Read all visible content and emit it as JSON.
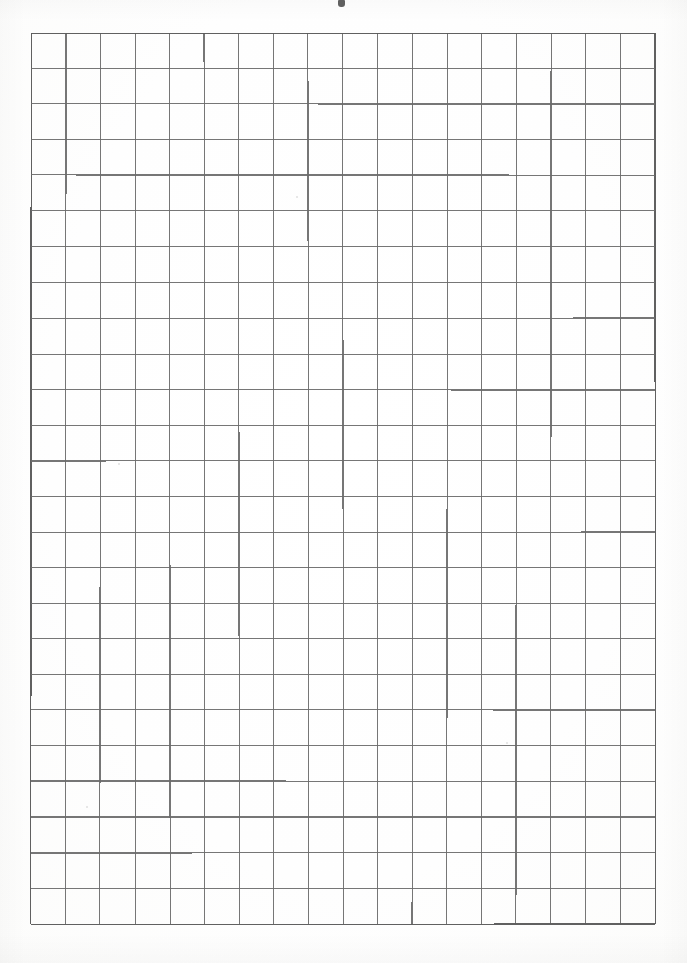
{
  "document": {
    "type": "scanned-grid-paper",
    "title": "Blank grid paper sheet",
    "description": "A scanned blank sheet of squared graph paper with no written content",
    "page_width_px": 687,
    "page_height_px": 963,
    "background_color": "#ffffff"
  },
  "grid": {
    "name": "squared-grid",
    "columns": 18,
    "rows": 25,
    "origin_x_px": 31,
    "origin_y_px": 33,
    "width_px": 624,
    "height_px": 891,
    "cell_width_px": 34.7,
    "cell_height_px": 35.6,
    "line_color": "#6b6b6b",
    "outer_line_color": "#5a5a5a",
    "line_width_px": 1.15,
    "outer_line_width_px": 1.45,
    "cell_fill": "#ffffff"
  },
  "artifacts": {
    "top_edge_mark": {
      "label": "scan-edge-mark",
      "x_px": 338,
      "y_px": 0,
      "color": "#3a3a3a"
    },
    "specks": [
      {
        "x_px": 118,
        "y_px": 463,
        "size_px": 2
      },
      {
        "x_px": 296,
        "y_px": 196,
        "size_px": 2
      },
      {
        "x_px": 506,
        "y_px": 742,
        "size_px": 2
      },
      {
        "x_px": 86,
        "y_px": 806,
        "size_px": 2
      }
    ]
  },
  "content": {
    "text_present": "none",
    "annotations": []
  }
}
